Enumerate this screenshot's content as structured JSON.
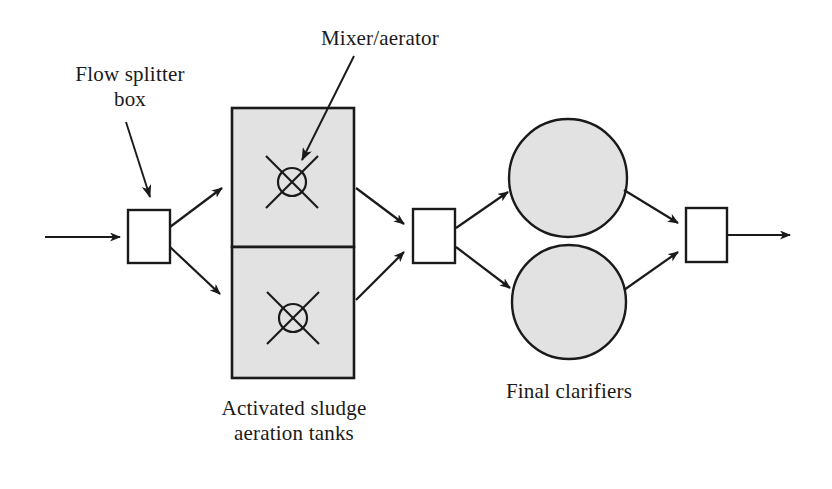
{
  "diagram": {
    "type": "process-flow",
    "background_color": "#ffffff",
    "line_color": "#1a1a1a",
    "fill_color": "#e0e0e0",
    "labels": {
      "flow_splitter_box": "Flow splitter\nbox",
      "mixer_aerator": "Mixer/aerator",
      "aeration_tanks": "Activated sludge\naeration tanks",
      "final_clarifiers": "Final clarifiers"
    },
    "nodes": [
      {
        "id": "influent-arrow",
        "name": "influent-flow-arrow",
        "shape": "arrow",
        "from": [
          45,
          237
        ],
        "to": [
          128,
          237
        ]
      },
      {
        "id": "splitter-box-1",
        "name": "flow-splitter-box",
        "shape": "rect",
        "x": 128,
        "y": 210,
        "width": 42,
        "height": 53,
        "fill": "#ffffff"
      },
      {
        "id": "aeration-tank-top",
        "name": "aeration-tank-upper",
        "shape": "rect",
        "x": 232,
        "y": 108,
        "width": 122,
        "height": 139,
        "fill": "#e0e0e0"
      },
      {
        "id": "aeration-tank-bottom",
        "name": "aeration-tank-lower",
        "shape": "rect",
        "x": 232,
        "y": 247,
        "width": 122,
        "height": 131,
        "fill": "#e0e0e0"
      },
      {
        "id": "mixer-top",
        "name": "mixer-aerator-symbol-upper",
        "shape": "circle-x",
        "cx": 292,
        "cy": 182,
        "r": 14,
        "arm": 26
      },
      {
        "id": "mixer-bottom",
        "name": "mixer-aerator-symbol-lower",
        "shape": "circle-x",
        "cx": 293,
        "cy": 318,
        "r": 14,
        "arm": 26
      },
      {
        "id": "splitter-box-2",
        "name": "intermediate-splitter-box",
        "shape": "rect",
        "x": 413,
        "y": 209,
        "width": 42,
        "height": 54,
        "fill": "#ffffff"
      },
      {
        "id": "clarifier-top",
        "name": "final-clarifier-upper",
        "shape": "circle",
        "cx": 568,
        "cy": 178,
        "r": 59,
        "fill": "#e0e0e0"
      },
      {
        "id": "clarifier-bottom",
        "name": "final-clarifier-lower",
        "shape": "circle",
        "cx": 569,
        "cy": 302,
        "r": 57,
        "fill": "#e0e0e0"
      },
      {
        "id": "splitter-box-3",
        "name": "effluent-collection-box",
        "shape": "rect",
        "x": 686,
        "y": 208,
        "width": 41,
        "height": 54,
        "fill": "#ffffff"
      },
      {
        "id": "effluent-arrow",
        "name": "effluent-flow-arrow",
        "shape": "arrow",
        "from": [
          727,
          235
        ],
        "to": [
          798,
          235
        ]
      }
    ],
    "connectors": [
      {
        "name": "splitter-to-tank-upper",
        "from": [
          170,
          227
        ],
        "to": [
          228,
          184
        ]
      },
      {
        "name": "splitter-to-tank-lower",
        "from": [
          170,
          247
        ],
        "to": [
          228,
          300
        ]
      },
      {
        "name": "tank-upper-to-midbox",
        "from": [
          356,
          188
        ],
        "to": [
          410,
          228
        ]
      },
      {
        "name": "tank-lower-to-midbox",
        "from": [
          356,
          300
        ],
        "to": [
          410,
          248
        ]
      },
      {
        "name": "midbox-to-clarifier-upper",
        "from": [
          456,
          228
        ],
        "to": [
          514,
          188
        ]
      },
      {
        "name": "midbox-to-clarifier-lower",
        "from": [
          456,
          247
        ],
        "to": [
          516,
          292
        ]
      },
      {
        "name": "clarifier-upper-to-outbox",
        "from": [
          624,
          190
        ],
        "to": [
          683,
          227
        ]
      },
      {
        "name": "clarifier-lower-to-outbox",
        "from": [
          624,
          290
        ],
        "to": [
          683,
          249
        ]
      }
    ],
    "annotation_arrows": [
      {
        "name": "flow-splitter-callout-arrow",
        "from": [
          128,
          122
        ],
        "to": [
          152,
          203
        ]
      },
      {
        "name": "mixer-aerator-callout-arrow",
        "from": [
          352,
          58
        ],
        "to": [
          300,
          166
        ]
      }
    ]
  }
}
